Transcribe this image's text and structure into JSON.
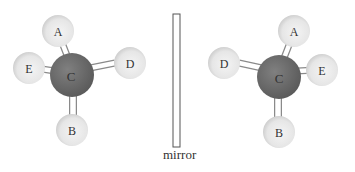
{
  "figure": {
    "mirror_label": "mirror",
    "colors": {
      "central_atom": "#6e6e6e",
      "outer_atom": "#e6e6e6",
      "outer_atom_shadow": "#bdbdbd",
      "bond": "#ffffff",
      "bond_outline": "#8a8a8a",
      "mirror_outline": "#555555"
    },
    "left_molecule": {
      "central": "C",
      "substituents": [
        {
          "label": "A",
          "position": "top"
        },
        {
          "label": "E",
          "position": "left"
        },
        {
          "label": "D",
          "position": "right"
        },
        {
          "label": "B",
          "position": "bottom"
        }
      ]
    },
    "right_molecule": {
      "central": "C",
      "substituents": [
        {
          "label": "A",
          "position": "top"
        },
        {
          "label": "D",
          "position": "left"
        },
        {
          "label": "E",
          "position": "right"
        },
        {
          "label": "B",
          "position": "bottom"
        }
      ]
    }
  }
}
